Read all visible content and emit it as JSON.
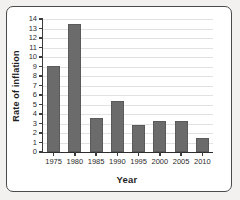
{
  "chart_data": {
    "type": "bar",
    "title": "",
    "xlabel": "Year",
    "ylabel": "Rate of inflation",
    "categories": [
      "1975",
      "1980",
      "1985",
      "1990",
      "1995",
      "2000",
      "2005",
      "2010"
    ],
    "values": [
      9.1,
      13.5,
      3.6,
      5.4,
      2.8,
      3.3,
      3.3,
      1.5
    ],
    "ylim": [
      0,
      14
    ],
    "ytick_labels": [
      "0",
      "1",
      "2",
      "3",
      "4",
      "5",
      "6",
      "7",
      "8",
      "9",
      "10",
      "11",
      "12",
      "13",
      "14"
    ],
    "ytick_step": 1,
    "grid": true,
    "grid_axis": "y",
    "legend": null,
    "bar_color": "#6b6b6b",
    "axis_color": "#2e2e2e",
    "grid_color": "#e2e2e2",
    "plot_background": "#ffffff",
    "figure_background": "#f2f1ef"
  }
}
